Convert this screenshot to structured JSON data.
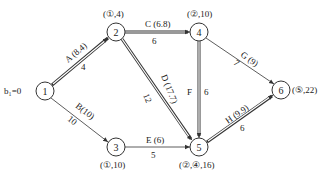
{
  "diagram": {
    "type": "network-schedule",
    "start_label": "b₁=0",
    "nodes": [
      {
        "id": "1",
        "label": "1",
        "x": 45,
        "y": 91,
        "annotation": ""
      },
      {
        "id": "2",
        "label": "2",
        "x": 116,
        "y": 32,
        "annotation": "(①,4)"
      },
      {
        "id": "3",
        "label": "3",
        "x": 116,
        "y": 147,
        "annotation": "(①,10)"
      },
      {
        "id": "4",
        "label": "4",
        "x": 199,
        "y": 32,
        "annotation": "(②,10)"
      },
      {
        "id": "5",
        "label": "5",
        "x": 199,
        "y": 147,
        "annotation": "(②,④,16)"
      },
      {
        "id": "6",
        "label": "6",
        "x": 281,
        "y": 90,
        "annotation": "(⑤,22)"
      }
    ],
    "edges": [
      {
        "id": "A",
        "from": "1",
        "to": "2",
        "label": "A (8.4)",
        "duration": "4",
        "critical": true
      },
      {
        "id": "B",
        "from": "1",
        "to": "3",
        "label": "B(10)",
        "duration": "10",
        "critical": false
      },
      {
        "id": "C",
        "from": "2",
        "to": "4",
        "label": "C (6.8)",
        "duration": "6",
        "critical": true
      },
      {
        "id": "D",
        "from": "2",
        "to": "5",
        "label": "D (17.7)",
        "duration": "12",
        "critical": true
      },
      {
        "id": "E",
        "from": "3",
        "to": "5",
        "label": "E (6)",
        "duration": "5",
        "critical": false
      },
      {
        "id": "F",
        "from": "4",
        "to": "5",
        "label": "F",
        "duration": "6",
        "critical": true
      },
      {
        "id": "G",
        "from": "4",
        "to": "6",
        "label": "G (9)",
        "duration": "7",
        "critical": false
      },
      {
        "id": "H",
        "from": "5",
        "to": "6",
        "label": "H (9.9)",
        "duration": "6",
        "critical": true
      }
    ]
  }
}
